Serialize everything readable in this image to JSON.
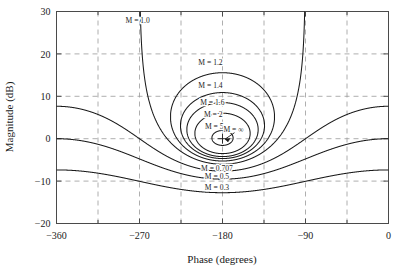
{
  "chart_data": {
    "type": "line",
    "title": "",
    "subtitle": "",
    "xlabel": "Phase (degrees)",
    "ylabel": "Magnitude (dB)",
    "xlim": [
      -360,
      0
    ],
    "ylim": [
      -20,
      30
    ],
    "xticks": [
      -360,
      -270,
      -180,
      -90,
      0
    ],
    "xticklabels": [
      "−360",
      "−270",
      "−180",
      "−90",
      "0"
    ],
    "yticks": [
      -20,
      -10,
      0,
      10,
      20,
      30
    ],
    "yticklabels": [
      "−20",
      "−10",
      "0",
      "10",
      "20",
      "30"
    ],
    "x_minor_ticks": [
      -315,
      -225,
      -135,
      -45
    ],
    "grid": true,
    "grid_style": "dashed",
    "grid_x": [
      -315,
      -270,
      -225,
      -180,
      -135,
      -90,
      -45
    ],
    "grid_y": [
      -10,
      0,
      10,
      20
    ],
    "legend": "none",
    "chart_kind": "nichols-constant-magnitude-contours",
    "series": [
      {
        "name": "M = 1.0",
        "M_linear": 1.0,
        "label": "M = 1.0",
        "closed": false,
        "label_x": -272,
        "label_y": 27.4
      },
      {
        "name": "M = 1.2",
        "M_linear": 1.2,
        "label": "M = 1.2",
        "closed": true,
        "label_x": -193,
        "label_y": 17.3
      },
      {
        "name": "M = 1.4",
        "M_linear": 1.4,
        "label": "M = 1.4",
        "closed": true,
        "label_x": -193,
        "label_y": 11.9
      },
      {
        "name": "M = 1.6",
        "M_linear": 1.6,
        "label": "M = 1.6",
        "closed": true,
        "label_x": -191,
        "label_y": 8.0
      },
      {
        "name": "M = 2",
        "M_linear": 2.0,
        "label": "M = 2",
        "closed": true,
        "label_x": -190,
        "label_y": 5.2
      },
      {
        "name": "M = 5",
        "M_linear": 5.0,
        "label": "M = 5",
        "closed": true,
        "label_x": -189,
        "label_y": 2.4
      },
      {
        "name": "M = ∞",
        "M_linear": null,
        "label": "M = ∞",
        "closed": false,
        "label_x": -168,
        "label_y": 1.6
      },
      {
        "name": "M = 0.707",
        "M_linear": 0.707,
        "label": "M = 0.707",
        "closed": false,
        "label_x": -186,
        "label_y": -7.5
      },
      {
        "name": "M = 0.5",
        "M_linear": 0.5,
        "label": "M = 0.5",
        "closed": false,
        "label_x": -186,
        "label_y": -9.6
      },
      {
        "name": "M = 0.3",
        "M_linear": 0.3,
        "label": "M = 0.3",
        "closed": false,
        "label_x": -186,
        "label_y": -12.2
      }
    ],
    "annotations": [
      {
        "text": "M = ∞ point",
        "x": -180,
        "y": 0,
        "marker": "crosshair"
      }
    ]
  },
  "figure": {
    "caption": "",
    "axis": {
      "xlabel": "Phase (degrees)",
      "ylabel": "Magnitude (dB)"
    }
  }
}
